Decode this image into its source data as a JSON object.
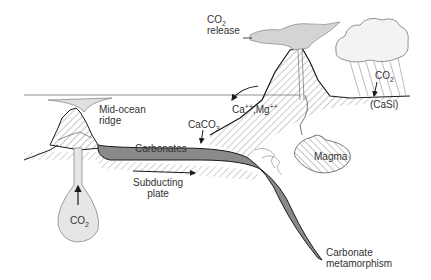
{
  "diagram": {
    "labels": {
      "co2_release_line1": "CO",
      "co2_release_sub": "2",
      "co2_release_line2": "release",
      "mid_ocean_ridge_line1": "Mid-ocean",
      "mid_ocean_ridge_line2": "ridge",
      "caco3_prefix": "CaCO",
      "caco3_sub": "3",
      "ions_ca": "Ca",
      "ions_ca_sup": "++",
      "ions_sep": ",Mg",
      "ions_mg_sup": "++",
      "weathering_co2": "CO",
      "weathering_co2_sub": "2",
      "casi": "(CaSi)",
      "carbonates": "Carbonates",
      "subducting_line1": "Subducting",
      "subducting_line2": "plate",
      "magma": "Magma",
      "plume_co2": "CO",
      "plume_co2_sub": "2",
      "metamorphism_line1": "Carbonate",
      "metamorphism_line2": "metamorphism"
    },
    "colors": {
      "carbonate_fill": "#8a8a8a",
      "plume_fill": "#e6e6e6",
      "smoke_fill": "#d4d4d4",
      "line": "#1a1a1a",
      "hatch": "#555555"
    }
  }
}
